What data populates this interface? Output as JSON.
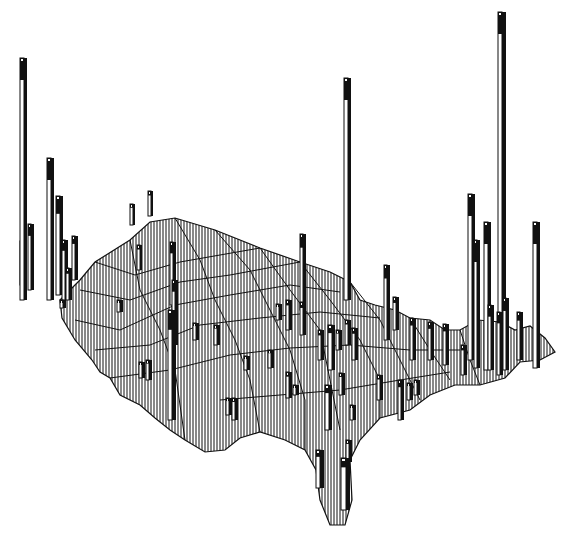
{
  "figure": {
    "type": "3d-prism-map",
    "colors": {
      "background": "#ffffff",
      "ink": "#111111",
      "bar_face": "#ffffff",
      "bar_side": "#111111"
    },
    "map_outline": [
      [
        60,
        300
      ],
      [
        80,
        280
      ],
      [
        95,
        262
      ],
      [
        130,
        240
      ],
      [
        150,
        222
      ],
      [
        175,
        218
      ],
      [
        215,
        230
      ],
      [
        260,
        248
      ],
      [
        300,
        262
      ],
      [
        330,
        272
      ],
      [
        350,
        282
      ],
      [
        360,
        300
      ],
      [
        375,
        305
      ],
      [
        395,
        310
      ],
      [
        410,
        318
      ],
      [
        430,
        320
      ],
      [
        445,
        330
      ],
      [
        460,
        330
      ],
      [
        478,
        320
      ],
      [
        500,
        322
      ],
      [
        515,
        330
      ],
      [
        530,
        326
      ],
      [
        545,
        338
      ],
      [
        555,
        352
      ],
      [
        540,
        360
      ],
      [
        520,
        362
      ],
      [
        505,
        378
      ],
      [
        480,
        385
      ],
      [
        455,
        385
      ],
      [
        430,
        395
      ],
      [
        410,
        410
      ],
      [
        380,
        418
      ],
      [
        360,
        440
      ],
      [
        350,
        460
      ],
      [
        352,
        500
      ],
      [
        345,
        525
      ],
      [
        330,
        525
      ],
      [
        320,
        500
      ],
      [
        316,
        470
      ],
      [
        305,
        450
      ],
      [
        285,
        440
      ],
      [
        260,
        432
      ],
      [
        240,
        438
      ],
      [
        225,
        450
      ],
      [
        205,
        452
      ],
      [
        185,
        440
      ],
      [
        170,
        430
      ],
      [
        155,
        418
      ],
      [
        140,
        405
      ],
      [
        120,
        395
      ],
      [
        110,
        378
      ],
      [
        100,
        372
      ],
      [
        92,
        360
      ],
      [
        75,
        340
      ],
      [
        62,
        318
      ]
    ],
    "state_lines": [
      [
        [
          95,
          262
        ],
        [
          135,
          275
        ],
        [
          180,
          262
        ],
        [
          220,
          255
        ],
        [
          260,
          248
        ]
      ],
      [
        [
          80,
          290
        ],
        [
          130,
          300
        ],
        [
          180,
          282
        ],
        [
          230,
          275
        ],
        [
          300,
          262
        ]
      ],
      [
        [
          75,
          320
        ],
        [
          120,
          330
        ],
        [
          175,
          305
        ],
        [
          230,
          295
        ],
        [
          290,
          285
        ],
        [
          340,
          292
        ]
      ],
      [
        [
          95,
          350
        ],
        [
          150,
          345
        ],
        [
          200,
          325
        ],
        [
          260,
          318
        ],
        [
          320,
          312
        ],
        [
          380,
          318
        ]
      ],
      [
        [
          110,
          378
        ],
        [
          170,
          370
        ],
        [
          230,
          355
        ],
        [
          290,
          348
        ],
        [
          350,
          345
        ],
        [
          410,
          350
        ],
        [
          460,
          350
        ]
      ],
      [
        [
          130,
          240
        ],
        [
          140,
          290
        ],
        [
          160,
          330
        ],
        [
          175,
          370
        ],
        [
          185,
          440
        ]
      ],
      [
        [
          175,
          218
        ],
        [
          200,
          260
        ],
        [
          215,
          300
        ],
        [
          235,
          340
        ],
        [
          250,
          380
        ],
        [
          260,
          432
        ]
      ],
      [
        [
          215,
          230
        ],
        [
          250,
          270
        ],
        [
          270,
          310
        ],
        [
          290,
          350
        ],
        [
          305,
          400
        ],
        [
          305,
          450
        ]
      ],
      [
        [
          260,
          248
        ],
        [
          290,
          290
        ],
        [
          320,
          330
        ],
        [
          330,
          380
        ],
        [
          340,
          430
        ]
      ],
      [
        [
          300,
          262
        ],
        [
          330,
          300
        ],
        [
          360,
          340
        ],
        [
          380,
          380
        ],
        [
          380,
          418
        ]
      ],
      [
        [
          350,
          282
        ],
        [
          380,
          320
        ],
        [
          400,
          360
        ],
        [
          420,
          400
        ]
      ],
      [
        [
          410,
          318
        ],
        [
          430,
          350
        ],
        [
          450,
          380
        ]
      ],
      [
        [
          460,
          330
        ],
        [
          470,
          360
        ],
        [
          480,
          385
        ]
      ],
      [
        [
          220,
          400
        ],
        [
          280,
          395
        ],
        [
          340,
          390
        ],
        [
          400,
          380
        ],
        [
          450,
          372
        ]
      ]
    ],
    "bars": [
      {
        "x": 20,
        "base": 300,
        "top": 58,
        "w": 7,
        "cap": "#111"
      },
      {
        "x": 47,
        "base": 300,
        "top": 158,
        "w": 7
      },
      {
        "x": 56,
        "base": 295,
        "top": 196,
        "w": 7
      },
      {
        "x": 28,
        "base": 290,
        "top": 224,
        "w": 6
      },
      {
        "x": 20,
        "base": 285,
        "top": 241,
        "w": 6
      },
      {
        "x": 62,
        "base": 300,
        "top": 240,
        "w": 6
      },
      {
        "x": 72,
        "base": 280,
        "top": 236,
        "w": 6
      },
      {
        "x": 49,
        "base": 278,
        "top": 250,
        "w": 5
      },
      {
        "x": 66,
        "base": 300,
        "top": 268,
        "w": 6
      },
      {
        "x": 60,
        "base": 308,
        "top": 300,
        "w": 6
      },
      {
        "x": 130,
        "base": 225,
        "top": 204,
        "w": 5
      },
      {
        "x": 148,
        "base": 216,
        "top": 191,
        "w": 5
      },
      {
        "x": 137,
        "base": 270,
        "top": 245,
        "w": 5
      },
      {
        "x": 170,
        "base": 305,
        "top": 242,
        "w": 6
      },
      {
        "x": 172,
        "base": 345,
        "top": 280,
        "w": 6
      },
      {
        "x": 168,
        "base": 420,
        "top": 310,
        "w": 8
      },
      {
        "x": 117,
        "base": 312,
        "top": 300,
        "w": 6
      },
      {
        "x": 139,
        "base": 378,
        "top": 362,
        "w": 6
      },
      {
        "x": 146,
        "base": 380,
        "top": 360,
        "w": 6
      },
      {
        "x": 193,
        "base": 340,
        "top": 323,
        "w": 6
      },
      {
        "x": 214,
        "base": 345,
        "top": 325,
        "w": 6
      },
      {
        "x": 244,
        "base": 370,
        "top": 356,
        "w": 6
      },
      {
        "x": 268,
        "base": 368,
        "top": 350,
        "w": 6
      },
      {
        "x": 300,
        "base": 310,
        "top": 234,
        "w": 6
      },
      {
        "x": 344,
        "base": 300,
        "top": 78,
        "w": 7
      },
      {
        "x": 276,
        "base": 320,
        "top": 304,
        "w": 6
      },
      {
        "x": 286,
        "base": 330,
        "top": 300,
        "w": 6
      },
      {
        "x": 300,
        "base": 335,
        "top": 302,
        "w": 6
      },
      {
        "x": 226,
        "base": 415,
        "top": 398,
        "w": 6
      },
      {
        "x": 232,
        "base": 420,
        "top": 398,
        "w": 6
      },
      {
        "x": 286,
        "base": 398,
        "top": 372,
        "w": 6
      },
      {
        "x": 293,
        "base": 395,
        "top": 385,
        "w": 6
      },
      {
        "x": 318,
        "base": 360,
        "top": 330,
        "w": 6
      },
      {
        "x": 328,
        "base": 370,
        "top": 325,
        "w": 7
      },
      {
        "x": 336,
        "base": 350,
        "top": 330,
        "w": 6
      },
      {
        "x": 345,
        "base": 345,
        "top": 320,
        "w": 6
      },
      {
        "x": 352,
        "base": 360,
        "top": 328,
        "w": 6
      },
      {
        "x": 325,
        "base": 430,
        "top": 385,
        "w": 7
      },
      {
        "x": 339,
        "base": 395,
        "top": 373,
        "w": 6
      },
      {
        "x": 350,
        "base": 420,
        "top": 405,
        "w": 6
      },
      {
        "x": 377,
        "base": 400,
        "top": 375,
        "w": 6
      },
      {
        "x": 384,
        "base": 340,
        "top": 265,
        "w": 6
      },
      {
        "x": 393,
        "base": 330,
        "top": 297,
        "w": 6
      },
      {
        "x": 398,
        "base": 420,
        "top": 380,
        "w": 6
      },
      {
        "x": 407,
        "base": 400,
        "top": 383,
        "w": 6
      },
      {
        "x": 414,
        "base": 395,
        "top": 380,
        "w": 6
      },
      {
        "x": 410,
        "base": 360,
        "top": 318,
        "w": 6
      },
      {
        "x": 428,
        "base": 360,
        "top": 322,
        "w": 6
      },
      {
        "x": 443,
        "base": 365,
        "top": 324,
        "w": 6
      },
      {
        "x": 468,
        "base": 360,
        "top": 194,
        "w": 7
      },
      {
        "x": 484,
        "base": 370,
        "top": 222,
        "w": 7
      },
      {
        "x": 518,
        "base": 12,
        "top": 12,
        "w": 0
      },
      {
        "x": 498,
        "base": 370,
        "top": 12,
        "w": 8
      },
      {
        "x": 474,
        "base": 368,
        "top": 240,
        "w": 6
      },
      {
        "x": 488,
        "base": 370,
        "top": 305,
        "w": 6
      },
      {
        "x": 497,
        "base": 375,
        "top": 312,
        "w": 6
      },
      {
        "x": 503,
        "base": 370,
        "top": 298,
        "w": 6
      },
      {
        "x": 533,
        "base": 368,
        "top": 222,
        "w": 7
      },
      {
        "x": 517,
        "base": 360,
        "top": 312,
        "w": 6
      },
      {
        "x": 461,
        "base": 375,
        "top": 345,
        "w": 6
      },
      {
        "x": 316,
        "base": 488,
        "top": 450,
        "w": 8
      },
      {
        "x": 341,
        "base": 510,
        "top": 458,
        "w": 9
      },
      {
        "x": 346,
        "base": 462,
        "top": 440,
        "w": 6
      }
    ]
  }
}
